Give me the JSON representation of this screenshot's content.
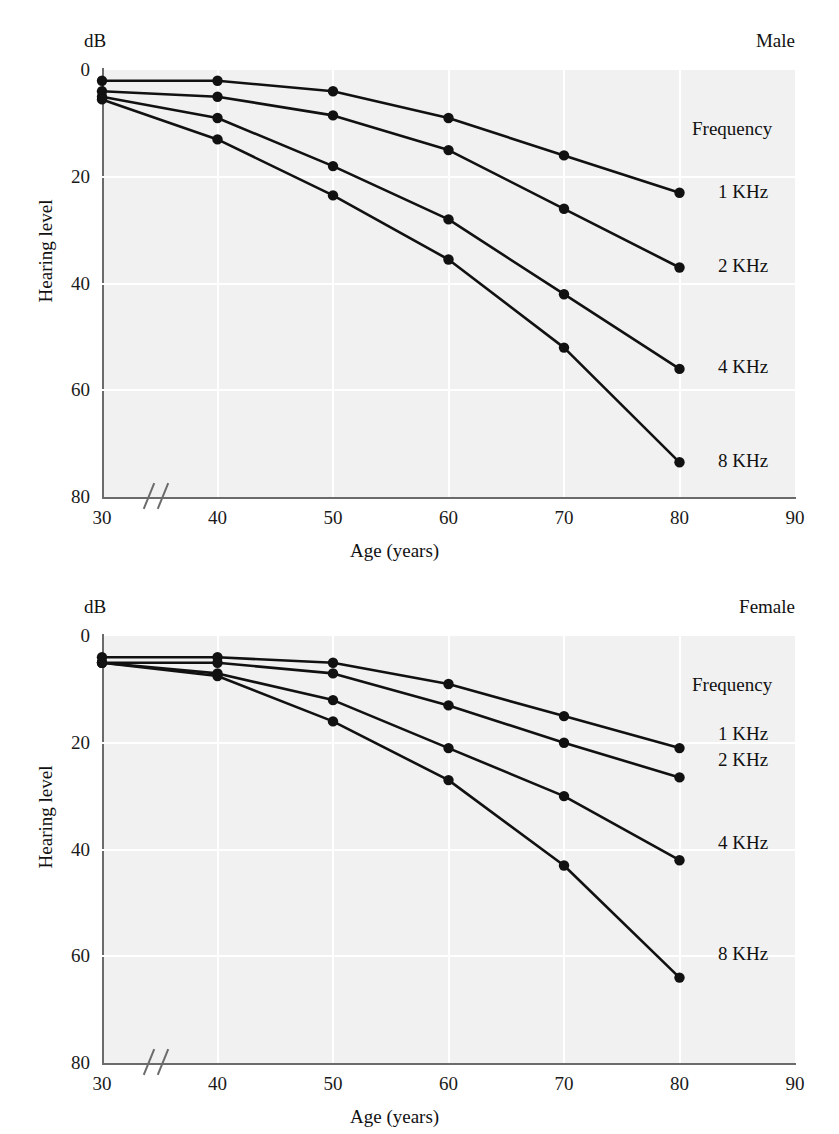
{
  "figure": {
    "unit_label": "dB",
    "y_axis_title": "Hearing level",
    "x_axis_title": "Age (years)",
    "legend_heading": "Frequency",
    "series_names": [
      "1 KHz",
      "2 KHz",
      "4 KHz",
      "8 KHz"
    ],
    "x_ticks": [
      "30",
      "40",
      "50",
      "60",
      "70",
      "80",
      "90"
    ],
    "y_ticks": [
      "0",
      "20",
      "40",
      "60",
      "80"
    ],
    "panel_titles": {
      "male": "Male",
      "female": "Female"
    },
    "colors": {
      "line": "#111111",
      "marker": "#111111",
      "plot_background": "#f1f1f1",
      "gridline": "#ffffff",
      "axis": "#6b6b6b",
      "text": "#1a1a1a"
    }
  },
  "chart_data": [
    {
      "type": "line",
      "title": "Male",
      "xlabel": "Age (years)",
      "ylabel": "Hearing level",
      "unit": "dB",
      "legend_title": "Frequency",
      "legend_position": "right",
      "grid": true,
      "x": [
        30,
        40,
        50,
        60,
        70,
        80
      ],
      "xlim": [
        30,
        90
      ],
      "xticks": [
        30,
        40,
        50,
        60,
        70,
        80,
        90
      ],
      "ylim": [
        0,
        80
      ],
      "yticks": [
        0,
        20,
        40,
        60,
        80
      ],
      "y_axis_inverted": true,
      "x_axis_break": true,
      "series": [
        {
          "name": "1 KHz",
          "values": [
            2,
            2,
            4,
            9,
            16,
            23
          ]
        },
        {
          "name": "2 KHz",
          "values": [
            4,
            5,
            8.5,
            15,
            26,
            37
          ]
        },
        {
          "name": "4 KHz",
          "values": [
            5,
            9,
            18,
            28,
            42,
            56
          ]
        },
        {
          "name": "8 KHz",
          "values": [
            5.5,
            13,
            23.5,
            35.5,
            52,
            73.5
          ]
        }
      ]
    },
    {
      "type": "line",
      "title": "Female",
      "xlabel": "Age (years)",
      "ylabel": "Hearing level",
      "unit": "dB",
      "legend_title": "Frequency",
      "legend_position": "right",
      "grid": true,
      "x": [
        30,
        40,
        50,
        60,
        70,
        80
      ],
      "xlim": [
        30,
        90
      ],
      "xticks": [
        30,
        40,
        50,
        60,
        70,
        80,
        90
      ],
      "ylim": [
        0,
        80
      ],
      "yticks": [
        0,
        20,
        40,
        60,
        80
      ],
      "y_axis_inverted": true,
      "x_axis_break": true,
      "series": [
        {
          "name": "1 KHz",
          "values": [
            4,
            4,
            5,
            9,
            15,
            21
          ]
        },
        {
          "name": "2 KHz",
          "values": [
            5,
            5,
            7,
            13,
            20,
            26.5
          ]
        },
        {
          "name": "4 KHz",
          "values": [
            5,
            7,
            12,
            21,
            30,
            42
          ]
        },
        {
          "name": "8 KHz",
          "values": [
            5,
            7.5,
            16,
            27,
            43,
            64
          ]
        }
      ]
    }
  ]
}
